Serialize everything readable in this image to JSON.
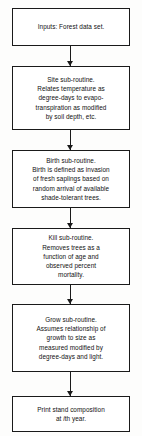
{
  "diagram": {
    "orientation": "vertical-top-to-bottom",
    "background_color": "#fdfdfc",
    "line_color": "#1a1a1a",
    "text_color": "#111111",
    "nodes": [
      {
        "id": "inputs",
        "name": "inputs-box",
        "text": "Inputs: Forest data set.",
        "top": 8,
        "height": 38
      },
      {
        "id": "site",
        "name": "site-subroutine-box",
        "text": "Site sub-routine.\nRelates temperature as\ndegree-days to evapo-\ntranspiration as modified\nby soil depth, etc.",
        "top": 66,
        "height": 64
      },
      {
        "id": "birth",
        "name": "birth-subroutine-box",
        "text": "Birth sub-routine.\nBirth is defined as invasion\nof fresh saplings based on\nrandom arrival of available\nshade-tolerant trees.",
        "top": 150,
        "height": 58
      },
      {
        "id": "kill",
        "name": "kill-subroutine-box",
        "text": "Kill sub-routine.\nRemoves trees as a\nfunction of age and\nobserved percent\nmortality.",
        "top": 228,
        "height": 57
      },
      {
        "id": "grow",
        "name": "grow-subroutine-box",
        "text": "Grow sub-routine.\nAssumes relationship of\ngrowth to size as\nmeasured modified by\ndegree-days and light.",
        "top": 304,
        "height": 68
      },
      {
        "id": "print",
        "name": "print-output-box",
        "text_before_italic": "Print stand composition\nat ",
        "text_italic": "i",
        "text_after_italic": "th year.",
        "top": 396,
        "height": 36
      }
    ],
    "connectors": [
      {
        "name": "connector-inputs-to-site",
        "top": 46,
        "height": 20
      },
      {
        "name": "connector-site-to-birth",
        "top": 130,
        "height": 20
      },
      {
        "name": "connector-birth-to-kill",
        "top": 208,
        "height": 20
      },
      {
        "name": "connector-kill-to-grow",
        "top": 285,
        "height": 19
      },
      {
        "name": "connector-grow-to-print",
        "top": 372,
        "height": 24
      }
    ]
  }
}
